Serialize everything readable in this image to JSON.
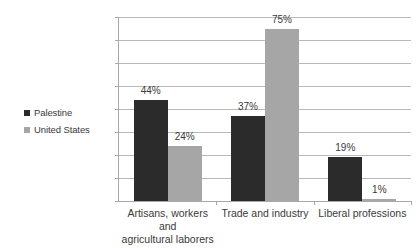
{
  "chart_data": {
    "type": "bar",
    "title": "",
    "subtitle": "",
    "xlabel": "",
    "ylabel": "",
    "categories": [
      "Artisans, workers and agricultural laborers",
      "Trade and industry",
      "Liberal professions"
    ],
    "series": [
      {
        "name": "Palestine",
        "color": "#2b2b2b",
        "values": [
          44,
          37,
          19
        ],
        "labels": [
          "44%",
          "37%",
          "19%"
        ]
      },
      {
        "name": "United States",
        "color": "#a6a6a6",
        "values": [
          24,
          75,
          1
        ],
        "labels": [
          "24%",
          "75%",
          "1%"
        ]
      }
    ],
    "ylim": [
      0,
      80
    ],
    "ytick_values": [
      0,
      10,
      20,
      30,
      40,
      50,
      60,
      70,
      80
    ],
    "ytick_labels": [
      "0%",
      "10%",
      "20%",
      "30%",
      "40%",
      "50%",
      "60%",
      "70%",
      "80%"
    ],
    "grid": "horizontal",
    "legend_position": "left",
    "value_labels": true
  },
  "legend": {
    "items": [
      {
        "label": "Palestine",
        "color": "#2b2b2b",
        "marker": "square-swatch-icon"
      },
      {
        "label": "United States",
        "color": "#a6a6a6",
        "marker": "square-swatch-icon"
      }
    ]
  },
  "axes": {
    "y": {
      "ticks": [
        "80%",
        "70%",
        "60%",
        "50%",
        "40%",
        "30%",
        "20%",
        "10%",
        "0%"
      ]
    },
    "x": {
      "category_lines": [
        [
          "Artisans, workers and",
          "agricultural laborers"
        ],
        [
          "Trade and industry"
        ],
        [
          "Liberal professions"
        ]
      ]
    }
  },
  "colors": {
    "background": "#ffffff",
    "gridline": "#b9b9b9",
    "axis": "#a8a8a8",
    "text": "#3a3a3a",
    "series_palestine": "#2b2b2b",
    "series_united_states": "#a6a6a6"
  }
}
